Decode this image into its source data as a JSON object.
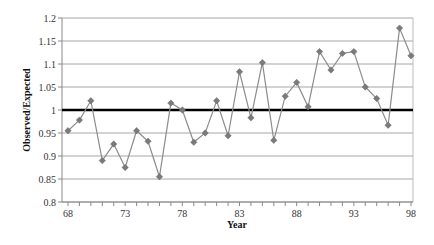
{
  "chart_data": {
    "type": "line",
    "title": "",
    "xlabel": "Year",
    "ylabel": "Observed/Expected",
    "ylim": [
      0.8,
      1.2
    ],
    "xlim": [
      68,
      98
    ],
    "grid": true,
    "legend": null,
    "y_ticks": [
      "0.8",
      "0.85",
      "0.9",
      "0.95",
      "1",
      "1.05",
      "1.1",
      "1.15",
      "1.2"
    ],
    "y_tick_values": [
      0.8,
      0.85,
      0.9,
      0.95,
      1.0,
      1.05,
      1.1,
      1.15,
      1.2
    ],
    "x_ticks": [
      "68",
      "73",
      "78",
      "83",
      "88",
      "93",
      "98"
    ],
    "x_tick_values": [
      68,
      73,
      78,
      83,
      88,
      93,
      98
    ],
    "reference_line": {
      "y": 1.0,
      "color": "#000000",
      "width": 2.5
    },
    "x": [
      68,
      69,
      70,
      71,
      72,
      73,
      74,
      75,
      76,
      77,
      78,
      79,
      80,
      81,
      82,
      83,
      84,
      85,
      86,
      87,
      88,
      89,
      90,
      91,
      92,
      93,
      94,
      95,
      96,
      97,
      98
    ],
    "series": [
      {
        "name": "Observed/Expected",
        "color": "#8c8c8c",
        "marker": "diamond",
        "values": [
          0.955,
          0.978,
          1.02,
          0.89,
          0.926,
          0.875,
          0.955,
          0.932,
          0.855,
          1.015,
          1.0,
          0.93,
          0.95,
          1.02,
          0.944,
          1.083,
          0.983,
          1.103,
          0.934,
          1.03,
          1.06,
          1.007,
          1.127,
          1.087,
          1.123,
          1.127,
          1.05,
          1.025,
          0.967,
          1.178,
          1.118
        ]
      }
    ]
  }
}
